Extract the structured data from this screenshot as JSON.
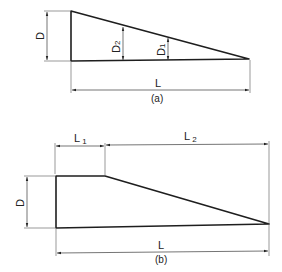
{
  "figure_a": {
    "caption": "(a)",
    "labels": {
      "depth": "D",
      "depth2": "D",
      "depth2_sub": "2",
      "depth1": "D",
      "depth1_sub": "1",
      "length": "L"
    }
  },
  "figure_b": {
    "caption": "(b)",
    "labels": {
      "depth": "D",
      "length1": "L",
      "length1_sub": "1",
      "length2": "L",
      "length2_sub": "2",
      "length": "L"
    }
  }
}
